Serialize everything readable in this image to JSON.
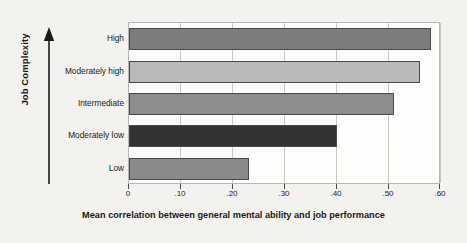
{
  "chart_data": {
    "type": "bar",
    "orientation": "horizontal",
    "title": "",
    "xlabel": "Mean correlation between general mental ability and job performance",
    "ylabel": "Job Complexity",
    "categories": [
      "High",
      "Moderately high",
      "Intermediate",
      "Moderately low",
      "Low"
    ],
    "values": [
      0.58,
      0.56,
      0.51,
      0.4,
      0.23
    ],
    "bar_colors": [
      "#7d7d7d",
      "#b9b9b9",
      "#8e8e8e",
      "#323232",
      "#8a8a8a"
    ],
    "bar_border_color": "#4a4a4a",
    "xlim": [
      0,
      0.6
    ],
    "xticks": [
      0,
      0.1,
      0.2,
      0.3,
      0.4,
      0.5,
      0.6
    ],
    "xtick_labels": [
      "0",
      ".10",
      ".20",
      ".30",
      ".40",
      ".50",
      ".60"
    ],
    "grid": "vertical",
    "legend": "none",
    "background_color": "#f4f2ee",
    "plot_background_color": "#fdfdfb",
    "y_axis_arrow": "up-arrow-icon"
  }
}
